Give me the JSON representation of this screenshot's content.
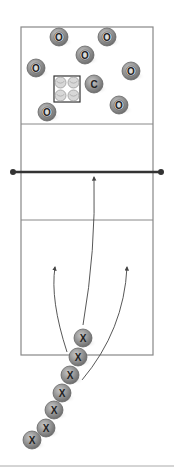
{
  "diagram": {
    "type": "volleyball-drill",
    "colors": {
      "court_line": "#888888",
      "net": "#333333",
      "player_fill": "#8a8a8a",
      "player_ring": "#666666",
      "arrow": "#444444",
      "bottom_rule": "#aaaaaa"
    },
    "court": {
      "x": 21,
      "y": 27,
      "width": 132,
      "height": 328
    },
    "attack_lines": [
      {
        "y": 124
      },
      {
        "y": 220
      }
    ],
    "net": {
      "y": 172,
      "x1": 13,
      "x2": 161
    },
    "equipment": {
      "label": "ball-cart",
      "x": 54,
      "y": 76,
      "size": 26
    },
    "opponents": [
      {
        "label": "O",
        "x": 59,
        "y": 37
      },
      {
        "label": "O",
        "x": 107,
        "y": 37
      },
      {
        "label": "O",
        "x": 85,
        "y": 55
      },
      {
        "label": "O",
        "x": 36,
        "y": 68
      },
      {
        "label": "O",
        "x": 131,
        "y": 71
      },
      {
        "label": "C",
        "x": 94,
        "y": 84
      },
      {
        "label": "O",
        "x": 119,
        "y": 105
      },
      {
        "label": "O",
        "x": 47,
        "y": 112
      }
    ],
    "players": [
      {
        "label": "X",
        "x": 83,
        "y": 338
      },
      {
        "label": "X",
        "x": 78,
        "y": 357
      },
      {
        "label": "X",
        "x": 70,
        "y": 375
      },
      {
        "label": "X",
        "x": 62,
        "y": 393
      },
      {
        "label": "X",
        "x": 54,
        "y": 410
      },
      {
        "label": "X",
        "x": 46,
        "y": 428
      },
      {
        "label": "X",
        "x": 32,
        "y": 440
      }
    ],
    "arrows": [
      {
        "name": "left-approach",
        "d": "M 67 352 Q 50 300 55 267"
      },
      {
        "name": "center-approach",
        "d": "M 83 325 Q 96 250 94 177"
      },
      {
        "name": "right-approach",
        "d": "M 82 380 Q 124 330 127 267"
      }
    ],
    "bottom_rule": {
      "y": 466
    }
  }
}
